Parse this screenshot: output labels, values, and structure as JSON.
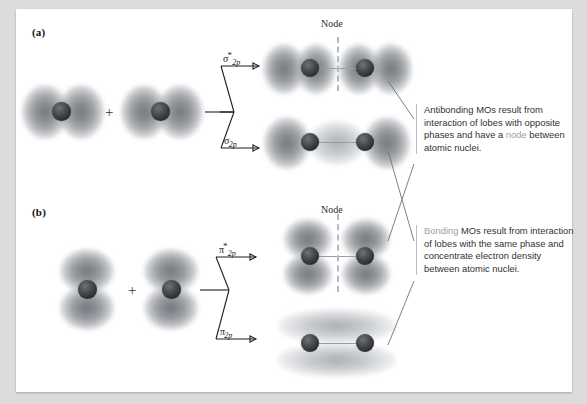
{
  "figure": {
    "panels": [
      {
        "letter": "(a)",
        "type": "sigma",
        "description": "Head-on overlap of two 2p orbitals lying along the internuclear axis"
      },
      {
        "letter": "(b)",
        "type": "pi",
        "description": "Side-by-side overlap of two 2p orbitals perpendicular to the internuclear axis"
      }
    ],
    "plus_symbol": "+",
    "node_labels": [
      {
        "id": "node-sigma-star",
        "text": "Node"
      },
      {
        "id": "node-pi-star",
        "text": "Node"
      }
    ],
    "mo_labels": [
      {
        "id": "sigma-star-2p",
        "symbol": "σ",
        "star": "*",
        "subscript": "2p",
        "orbital": "antibonding sigma"
      },
      {
        "id": "sigma-2p",
        "symbol": "σ",
        "star": "",
        "subscript": "2p",
        "orbital": "bonding sigma"
      },
      {
        "id": "pi-star-2p",
        "symbol": "π",
        "star": "*",
        "subscript": "2p",
        "orbital": "antibonding pi"
      },
      {
        "id": "pi-2p",
        "symbol": "π",
        "star": "",
        "subscript": "2p",
        "orbital": "bonding pi"
      }
    ],
    "descriptions": [
      {
        "id": "antibonding-note",
        "highlight_lead": "",
        "highlight_inline": "node",
        "text_before": "Antibonding MOs result from interaction of lobes with opposite phases and have a ",
        "text_after": " between atomic nuclei.",
        "full_text": "Antibonding MOs result from interaction of lobes with opposite phases and have a node between atomic nuclei."
      },
      {
        "id": "bonding-note",
        "highlight_lead": "Bonding",
        "highlight_inline": "",
        "text_before": "",
        "text_after": " MOs result from interaction of lobes with the same phase and concentrate electron density between atomic nuclei.",
        "full_text": "Bonding MOs result from interaction of lobes with the same phase and concentrate electron density between atomic nuclei."
      }
    ],
    "colors": {
      "page_background": "#dcdcdc",
      "panel_background": "#ffffff",
      "orbital_lobe": "#82868c",
      "nucleus": "#2c2f33",
      "node_dash": "#b6b9be",
      "arrow": "#1c1f22",
      "connector": "#6e7277",
      "text": "#2f3235",
      "highlight_text": "#9aa0a6"
    }
  }
}
